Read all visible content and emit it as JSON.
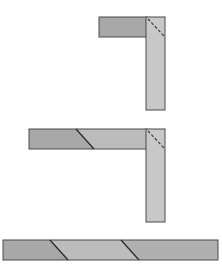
{
  "diagram": {
    "colors": {
      "dark_fill": "#a8a8a8",
      "light_fill": "#c8c8c8",
      "stroke": "#4a4a4a",
      "background": "#ffffff"
    },
    "stage1": {
      "horizontal": {
        "x": 99,
        "y": 17,
        "w": 48,
        "h": 20
      },
      "vertical": {
        "x": 146,
        "y": 17,
        "w": 19,
        "h": 93
      },
      "dashed_fold": {
        "x1": 148,
        "y1": 19,
        "x2": 164,
        "y2": 36
      }
    },
    "stage2": {
      "horizontal_left": {
        "x": 29,
        "y": 129,
        "w": 77,
        "h": 20
      },
      "horizontal_right": {
        "x": 75,
        "y": 129,
        "w": 72,
        "h": 20
      },
      "vertical": {
        "x": 146,
        "y": 129,
        "w": 19,
        "h": 93
      },
      "solid_diagonal": {
        "x1": 76,
        "y1": 129,
        "x2": 94,
        "y2": 149
      },
      "dashed_fold": {
        "x1": 148,
        "y1": 131,
        "x2": 164,
        "y2": 148
      }
    },
    "stage3": {
      "bar": {
        "x": 3,
        "y": 240,
        "w": 215,
        "h": 20
      },
      "diagonals": [
        {
          "x1": 50,
          "y1": 240,
          "x2": 68,
          "y2": 260
        },
        {
          "x1": 121,
          "y1": 240,
          "x2": 139,
          "y2": 260
        }
      ]
    }
  }
}
